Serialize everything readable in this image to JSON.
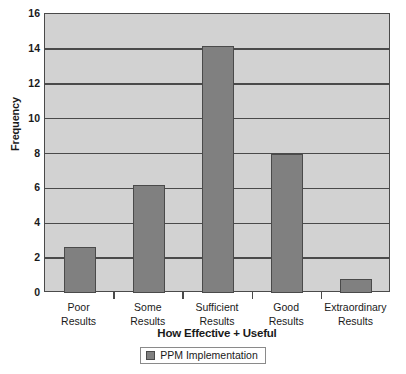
{
  "chart_data": {
    "type": "bar",
    "title": "",
    "xlabel": "How Effective + Useful",
    "ylabel": "Frequency",
    "categories": [
      "Poor Results",
      "Some Results",
      "Sufficient Results",
      "Good Results",
      "Extraordinary Results"
    ],
    "category_lines": [
      [
        "Poor",
        "Results"
      ],
      [
        "Some",
        "Results"
      ],
      [
        "Sufficient",
        "Results"
      ],
      [
        "Good",
        "Results"
      ],
      [
        "Extraordinary",
        "Results"
      ]
    ],
    "values": [
      2.65,
      6.2,
      14.15,
      8.0,
      0.8
    ],
    "series": [
      {
        "name": "PPM Implementation",
        "values": [
          2.65,
          6.2,
          14.15,
          8.0,
          0.8
        ]
      }
    ],
    "ylim": [
      0,
      16
    ],
    "ytick_step": 2,
    "ytick_labels": [
      "16",
      "14",
      "12",
      "10",
      "8",
      "6",
      "4",
      "2",
      "0"
    ],
    "ytick_values": [
      16,
      14,
      12,
      10,
      8,
      6,
      4,
      2,
      0
    ],
    "grid": true,
    "legend": {
      "position": "bottom-center",
      "entries": [
        {
          "label": "PPM Implementation",
          "swatch": "bar-color-swatch"
        }
      ]
    },
    "colors": {
      "bar_fill": "#808080",
      "bar_border": "#4a4a4a",
      "plot_background": "#d2d2d2",
      "gridline": "#4a4a4a",
      "axis": "#4a4a4a",
      "page_background": "#ffffff",
      "text": "#1a1a1a"
    }
  }
}
